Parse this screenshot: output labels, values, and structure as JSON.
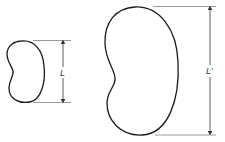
{
  "diagram": {
    "shapes": [
      {
        "name": "small-bean",
        "dimension_label": "L"
      },
      {
        "name": "large-bean",
        "dimension_label": "L′"
      }
    ],
    "colors": {
      "outline": "#1a1a1a",
      "dimension": "#444444",
      "background": "#ffffff"
    }
  }
}
